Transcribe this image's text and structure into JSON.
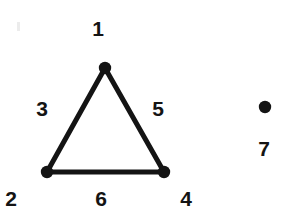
{
  "diagram": {
    "background_color": "#ffffff",
    "ink_color": "#141414",
    "width": 285,
    "height": 216,
    "nodes": [
      {
        "id": "apex",
        "label": "1",
        "cx": 105,
        "cy": 68,
        "r": 6,
        "label_x": 98,
        "label_y": 28
      },
      {
        "id": "bottom-left",
        "label": "2",
        "cx": 47,
        "cy": 172,
        "r": 6,
        "label_x": 11,
        "label_y": 198
      },
      {
        "id": "bottom-right",
        "label": "4",
        "cx": 164,
        "cy": 172,
        "r": 6,
        "label_x": 186,
        "label_y": 198
      },
      {
        "id": "isolated",
        "label": "7",
        "cx": 265,
        "cy": 107,
        "r": 6,
        "label_x": 264,
        "label_y": 148
      }
    ],
    "edges": [
      {
        "id": "left-edge",
        "label": "3",
        "from": "apex",
        "to": "bottom-left",
        "x1": 105,
        "y1": 68,
        "x2": 47,
        "y2": 172,
        "width": 5,
        "label_x": 42,
        "label_y": 108
      },
      {
        "id": "right-edge",
        "label": "5",
        "from": "apex",
        "to": "bottom-right",
        "x1": 105,
        "y1": 68,
        "x2": 164,
        "y2": 172,
        "width": 5,
        "label_x": 158,
        "label_y": 108
      },
      {
        "id": "bottom-edge",
        "label": "6",
        "from": "bottom-left",
        "to": "bottom-right",
        "x1": 47,
        "y1": 172,
        "x2": 164,
        "y2": 172,
        "width": 5,
        "label_x": 101,
        "label_y": 198
      }
    ],
    "labels": [
      {
        "id": "label-1",
        "text": "1",
        "x": 98,
        "y": 28,
        "refers_to": "node-apex"
      },
      {
        "id": "label-2",
        "text": "2",
        "x": 11,
        "y": 198,
        "refers_to": "node-bottom-left"
      },
      {
        "id": "label-3",
        "text": "3",
        "x": 42,
        "y": 108,
        "refers_to": "edge-left"
      },
      {
        "id": "label-4",
        "text": "4",
        "x": 186,
        "y": 198,
        "refers_to": "node-bottom-right"
      },
      {
        "id": "label-5",
        "text": "5",
        "x": 158,
        "y": 108,
        "refers_to": "edge-right"
      },
      {
        "id": "label-6",
        "text": "6",
        "x": 101,
        "y": 198,
        "refers_to": "edge-bottom"
      },
      {
        "id": "label-7",
        "text": "7",
        "x": 264,
        "y": 148,
        "refers_to": "node-isolated"
      }
    ]
  }
}
